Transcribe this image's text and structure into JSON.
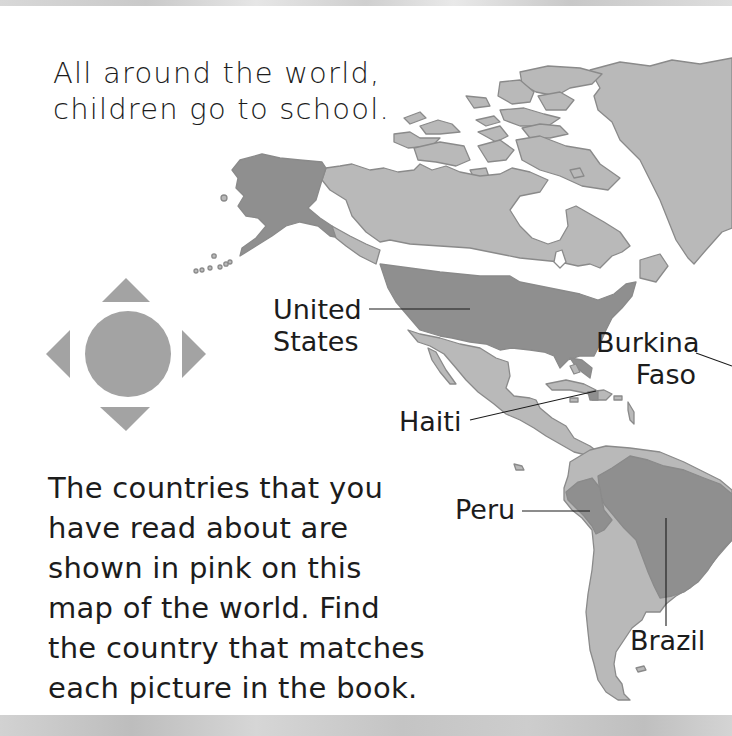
{
  "page": {
    "intro_lines": [
      "All around the world,",
      "children go to school."
    ],
    "body_lines": [
      "The countries that you",
      "have read about are",
      "shown in pink on this",
      "map of the world. Find",
      "the country that matches",
      "each picture in the book."
    ]
  },
  "map": {
    "region": "Americas",
    "labels": [
      {
        "id": "united-states",
        "lines": [
          "United",
          "States"
        ]
      },
      {
        "id": "burkina-faso",
        "lines": [
          "Burkina",
          "Faso"
        ]
      },
      {
        "id": "haiti",
        "lines": [
          "Haiti"
        ]
      },
      {
        "id": "peru",
        "lines": [
          "Peru"
        ]
      },
      {
        "id": "brazil",
        "lines": [
          "Brazil"
        ]
      }
    ],
    "highlighted_countries": [
      "United States",
      "Haiti",
      "Peru",
      "Brazil",
      "Burkina Faso"
    ]
  },
  "navigation": {
    "control": "directional-pad",
    "directions": [
      "up",
      "down",
      "left",
      "right"
    ],
    "center": "center-button"
  },
  "colors": {
    "land": "#b9b9b9",
    "land_outline": "#8a8a8a",
    "highlighted_land": "#8f8f8f",
    "compass": "#a3a3a3",
    "text": "#1c1c1c",
    "background": "#ffffff"
  }
}
